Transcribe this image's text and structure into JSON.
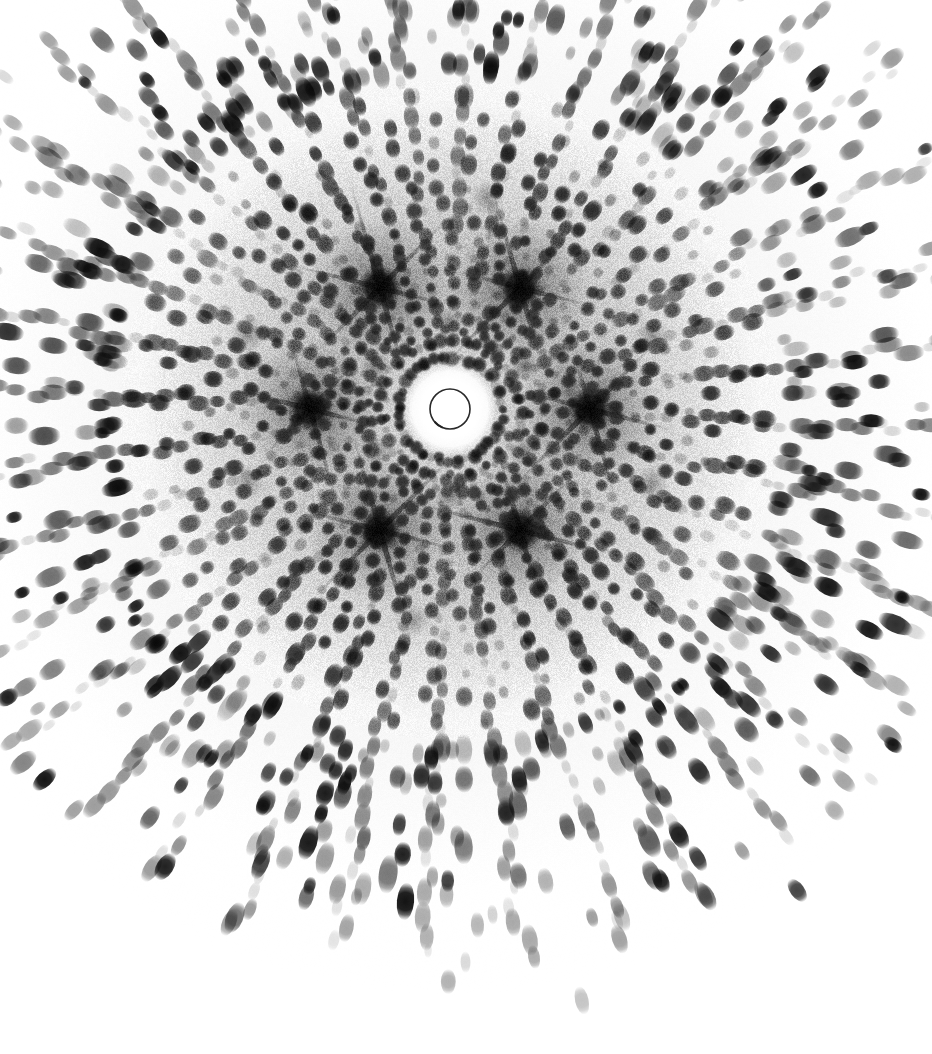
{
  "image": {
    "kind": "x-ray-diffraction-pattern",
    "description": "Single-crystal X-ray diffraction photograph (rotation / Laue still) showing concentric and radial arrays of Bragg reflections around a central beamstop shadow.",
    "width": 932,
    "height": 1054,
    "background_color": "#ffffff",
    "spot_color": "#111111",
    "halo_color": "#b9b9b9",
    "caption": ""
  },
  "chart_data": {
    "type": "scatter",
    "title": "",
    "xlabel": "",
    "ylabel": "",
    "xlim": [
      0,
      932
    ],
    "ylim": [
      0,
      1054
    ],
    "grid": false,
    "legend": null,
    "beam_center": {
      "x": 450,
      "y": 409
    },
    "beamstop": {
      "outline_radius": 20,
      "outline_color": "#2a2a2a",
      "outline_width": 1.6,
      "overexposed_halo_radius": 46,
      "overexposed_color": "#ffffff"
    },
    "background_fog": {
      "inner_radius": 40,
      "outer_radius": 310,
      "peak_gray": "#a8a8a8",
      "grain_amplitude": 26
    },
    "symmetry_fold": 6,
    "zone_axis_blobs": [
      {
        "angle_deg": 0,
        "radius": 140,
        "size": 30,
        "darkness": 0.92,
        "streaks": 6
      },
      {
        "angle_deg": 60,
        "radius": 140,
        "size": 30,
        "darkness": 0.92,
        "streaks": 6
      },
      {
        "angle_deg": 120,
        "radius": 140,
        "size": 30,
        "darkness": 0.92,
        "streaks": 6
      },
      {
        "angle_deg": 180,
        "radius": 140,
        "size": 30,
        "darkness": 0.92,
        "streaks": 6
      },
      {
        "angle_deg": 240,
        "radius": 140,
        "size": 30,
        "darkness": 0.92,
        "streaks": 6
      },
      {
        "angle_deg": 300,
        "radius": 140,
        "size": 30,
        "darkness": 0.92,
        "streaks": 6
      }
    ],
    "secondary_blobs": [
      {
        "angle_deg": 30,
        "radius": 86,
        "size": 16,
        "darkness": 0.55
      },
      {
        "angle_deg": 90,
        "radius": 86,
        "size": 16,
        "darkness": 0.55
      },
      {
        "angle_deg": 150,
        "radius": 86,
        "size": 16,
        "darkness": 0.55
      },
      {
        "angle_deg": 210,
        "radius": 86,
        "size": 16,
        "darkness": 0.55
      },
      {
        "angle_deg": 270,
        "radius": 86,
        "size": 16,
        "darkness": 0.55
      },
      {
        "angle_deg": 330,
        "radius": 86,
        "size": 16,
        "darkness": 0.55
      },
      {
        "angle_deg": 20,
        "radius": 215,
        "size": 18,
        "darkness": 0.42
      },
      {
        "angle_deg": 100,
        "radius": 215,
        "size": 18,
        "darkness": 0.42
      },
      {
        "angle_deg": 160,
        "radius": 215,
        "size": 18,
        "darkness": 0.42
      },
      {
        "angle_deg": 200,
        "radius": 215,
        "size": 18,
        "darkness": 0.42
      },
      {
        "angle_deg": 280,
        "radius": 215,
        "size": 18,
        "darkness": 0.42
      },
      {
        "angle_deg": 340,
        "radius": 215,
        "size": 18,
        "darkness": 0.42
      }
    ],
    "rings": [
      {
        "name": "ring-01",
        "radius": 52,
        "spot_count": 18,
        "spot_size": 5.2,
        "elongation": 1.05,
        "darkness": 0.7,
        "phase_deg": 0,
        "jitter": 2.0
      },
      {
        "name": "ring-02",
        "radius": 66,
        "spot_count": 22,
        "spot_size": 5.6,
        "elongation": 1.05,
        "darkness": 0.76,
        "phase_deg": 8,
        "jitter": 2.0
      },
      {
        "name": "ring-03",
        "radius": 80,
        "spot_count": 26,
        "spot_size": 6.0,
        "elongation": 1.06,
        "darkness": 0.8,
        "phase_deg": 4,
        "jitter": 2.2
      },
      {
        "name": "ring-04",
        "radius": 94,
        "spot_count": 30,
        "spot_size": 6.2,
        "elongation": 1.08,
        "darkness": 0.84,
        "phase_deg": 11,
        "jitter": 2.2
      },
      {
        "name": "ring-05",
        "radius": 108,
        "spot_count": 32,
        "spot_size": 6.4,
        "elongation": 1.08,
        "darkness": 0.86,
        "phase_deg": 2,
        "jitter": 2.4
      },
      {
        "name": "ring-06",
        "radius": 122,
        "spot_count": 34,
        "spot_size": 6.6,
        "elongation": 1.1,
        "darkness": 0.88,
        "phase_deg": 7,
        "jitter": 2.4
      },
      {
        "name": "ring-07",
        "radius": 137,
        "spot_count": 36,
        "spot_size": 6.8,
        "elongation": 1.1,
        "darkness": 0.9,
        "phase_deg": 0,
        "jitter": 2.6
      },
      {
        "name": "ring-08",
        "radius": 152,
        "spot_count": 38,
        "spot_size": 6.8,
        "elongation": 1.12,
        "darkness": 0.9,
        "phase_deg": 5,
        "jitter": 2.6
      },
      {
        "name": "ring-09",
        "radius": 168,
        "spot_count": 40,
        "spot_size": 7.0,
        "elongation": 1.14,
        "darkness": 0.88,
        "phase_deg": 9,
        "jitter": 2.8
      },
      {
        "name": "ring-10",
        "radius": 185,
        "spot_count": 42,
        "spot_size": 7.0,
        "elongation": 1.16,
        "darkness": 0.87,
        "phase_deg": 3,
        "jitter": 3.0
      },
      {
        "name": "ring-11",
        "radius": 203,
        "spot_count": 44,
        "spot_size": 7.2,
        "elongation": 1.2,
        "darkness": 0.86,
        "phase_deg": 6,
        "jitter": 3.0
      },
      {
        "name": "ring-12",
        "radius": 222,
        "spot_count": 46,
        "spot_size": 7.2,
        "elongation": 1.24,
        "darkness": 0.85,
        "phase_deg": 1,
        "jitter": 3.2
      },
      {
        "name": "ring-13",
        "radius": 242,
        "spot_count": 46,
        "spot_size": 7.4,
        "elongation": 1.3,
        "darkness": 0.84,
        "phase_deg": 8,
        "jitter": 3.4
      },
      {
        "name": "ring-14",
        "radius": 264,
        "spot_count": 44,
        "spot_size": 7.4,
        "elongation": 1.36,
        "darkness": 0.82,
        "phase_deg": 4,
        "jitter": 3.6
      },
      {
        "name": "ring-15",
        "radius": 288,
        "spot_count": 42,
        "spot_size": 7.6,
        "elongation": 1.42,
        "darkness": 0.8,
        "phase_deg": 10,
        "jitter": 3.8
      },
      {
        "name": "ring-16",
        "radius": 314,
        "spot_count": 40,
        "spot_size": 7.6,
        "elongation": 1.5,
        "darkness": 0.78,
        "phase_deg": 2,
        "jitter": 4.0
      },
      {
        "name": "ring-17",
        "radius": 342,
        "spot_count": 38,
        "spot_size": 7.8,
        "elongation": 1.58,
        "darkness": 0.76,
        "phase_deg": 7,
        "jitter": 4.2
      },
      {
        "name": "ring-18",
        "radius": 372,
        "spot_count": 34,
        "spot_size": 7.8,
        "elongation": 1.66,
        "darkness": 0.74,
        "phase_deg": 3,
        "jitter": 4.4
      },
      {
        "name": "ring-19",
        "radius": 404,
        "spot_count": 30,
        "spot_size": 8.0,
        "elongation": 1.74,
        "darkness": 0.72,
        "phase_deg": 9,
        "jitter": 4.6
      },
      {
        "name": "ring-20",
        "radius": 438,
        "spot_count": 26,
        "spot_size": 8.0,
        "elongation": 1.82,
        "darkness": 0.7,
        "phase_deg": 5,
        "jitter": 4.8
      },
      {
        "name": "ring-21",
        "radius": 474,
        "spot_count": 22,
        "spot_size": 8.2,
        "elongation": 1.9,
        "darkness": 0.66,
        "phase_deg": 0,
        "jitter": 5.0
      },
      {
        "name": "ring-22",
        "radius": 512,
        "spot_count": 18,
        "spot_size": 8.2,
        "elongation": 1.96,
        "darkness": 0.62,
        "phase_deg": 6,
        "jitter": 5.2
      },
      {
        "name": "ring-23",
        "radius": 552,
        "spot_count": 14,
        "spot_size": 8.4,
        "elongation": 2.0,
        "darkness": 0.58,
        "phase_deg": 11,
        "jitter": 5.4
      }
    ],
    "radial_rows": {
      "count": 36,
      "start_radius": 52,
      "end_radius": 560,
      "spacing": 17,
      "spot_size": 7.0,
      "note": "Reflections also line up along radial rows (lattice rows), producing the spoke appearance."
    },
    "faint_spot_fraction": 0.28,
    "outer_extent_radius": 600
  },
  "labels": {
    "center_marker": "beamstop",
    "pattern_name": "diffraction-pattern"
  }
}
